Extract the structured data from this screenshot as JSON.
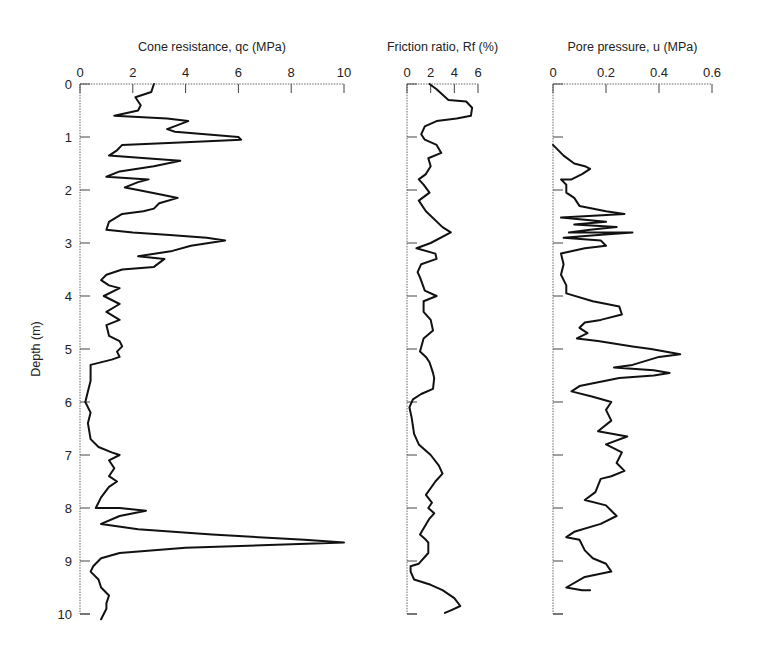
{
  "figure": {
    "ylabel": "Depth (m)"
  },
  "chart_data": [
    {
      "type": "line",
      "title": "Cone resistance, qc (MPa)",
      "xlabel": "Cone resistance, qc (MPa)",
      "ylabel": "Depth (m)",
      "xlim": [
        0,
        10
      ],
      "ylim": [
        10,
        0
      ],
      "x_ticks": [
        0,
        2,
        4,
        6,
        8,
        10
      ],
      "y_ticks": [
        0,
        1,
        2,
        3,
        4,
        5,
        6,
        7,
        8,
        9,
        10
      ],
      "x_axis_position": "top",
      "grid": false,
      "series": [
        {
          "name": "qc",
          "points": [
            [
              2.8,
              0.0
            ],
            [
              2.7,
              0.15
            ],
            [
              2.1,
              0.25
            ],
            [
              2.3,
              0.4
            ],
            [
              2.2,
              0.5
            ],
            [
              1.3,
              0.6
            ],
            [
              3.3,
              0.65
            ],
            [
              4.1,
              0.7
            ],
            [
              3.3,
              0.85
            ],
            [
              3.6,
              0.9
            ],
            [
              6.0,
              1.0
            ],
            [
              6.1,
              1.05
            ],
            [
              4.0,
              1.1
            ],
            [
              1.6,
              1.15
            ],
            [
              1.4,
              1.25
            ],
            [
              1.1,
              1.35
            ],
            [
              2.5,
              1.4
            ],
            [
              3.8,
              1.45
            ],
            [
              2.8,
              1.55
            ],
            [
              1.5,
              1.65
            ],
            [
              1.0,
              1.75
            ],
            [
              2.6,
              1.8
            ],
            [
              2.2,
              1.85
            ],
            [
              1.7,
              1.95
            ],
            [
              2.2,
              2.0
            ],
            [
              3.2,
              2.1
            ],
            [
              3.7,
              2.15
            ],
            [
              3.0,
              2.25
            ],
            [
              2.8,
              2.35
            ],
            [
              2.4,
              2.4
            ],
            [
              1.6,
              2.45
            ],
            [
              1.1,
              2.6
            ],
            [
              1.0,
              2.75
            ],
            [
              2.0,
              2.8
            ],
            [
              3.4,
              2.85
            ],
            [
              4.8,
              2.9
            ],
            [
              5.5,
              2.95
            ],
            [
              4.2,
              3.05
            ],
            [
              3.5,
              3.15
            ],
            [
              2.2,
              3.25
            ],
            [
              3.2,
              3.3
            ],
            [
              2.8,
              3.45
            ],
            [
              1.6,
              3.5
            ],
            [
              1.0,
              3.6
            ],
            [
              0.8,
              3.7
            ],
            [
              1.1,
              3.8
            ],
            [
              1.5,
              3.85
            ],
            [
              0.9,
              4.0
            ],
            [
              1.5,
              4.15
            ],
            [
              1.0,
              4.3
            ],
            [
              1.5,
              4.45
            ],
            [
              1.0,
              4.55
            ],
            [
              1.1,
              4.75
            ],
            [
              1.5,
              4.85
            ],
            [
              1.6,
              4.95
            ],
            [
              1.4,
              5.05
            ],
            [
              1.5,
              5.15
            ],
            [
              1.2,
              5.2
            ],
            [
              0.4,
              5.3
            ],
            [
              0.4,
              5.6
            ],
            [
              0.3,
              5.8
            ],
            [
              0.2,
              6.0
            ],
            [
              0.4,
              6.2
            ],
            [
              0.3,
              6.4
            ],
            [
              0.4,
              6.7
            ],
            [
              0.7,
              6.85
            ],
            [
              1.2,
              6.95
            ],
            [
              1.5,
              7.0
            ],
            [
              1.1,
              7.1
            ],
            [
              1.3,
              7.25
            ],
            [
              1.1,
              7.4
            ],
            [
              1.4,
              7.5
            ],
            [
              1.1,
              7.6
            ],
            [
              0.8,
              7.8
            ],
            [
              0.6,
              8.0
            ],
            [
              1.5,
              8.0
            ],
            [
              2.5,
              8.05
            ],
            [
              1.5,
              8.15
            ],
            [
              0.8,
              8.3
            ],
            [
              2.2,
              8.4
            ],
            [
              5.0,
              8.5
            ],
            [
              8.5,
              8.6
            ],
            [
              10.0,
              8.65
            ],
            [
              8.3,
              8.68
            ],
            [
              4.0,
              8.75
            ],
            [
              1.5,
              8.85
            ],
            [
              0.8,
              8.95
            ],
            [
              0.5,
              9.1
            ],
            [
              0.4,
              9.2
            ],
            [
              0.7,
              9.35
            ],
            [
              0.8,
              9.5
            ],
            [
              1.1,
              9.65
            ],
            [
              1.0,
              9.8
            ],
            [
              1.0,
              9.9
            ],
            [
              0.8,
              10.1
            ]
          ]
        }
      ]
    },
    {
      "type": "line",
      "title": "Friction ratio, Rf (%)",
      "xlabel": "Friction ratio, Rf (%)",
      "ylabel": "Depth (m)",
      "xlim": [
        0,
        6
      ],
      "ylim": [
        10,
        0
      ],
      "x_ticks": [
        0,
        2,
        4,
        6
      ],
      "x_axis_position": "top",
      "grid": false,
      "series": [
        {
          "name": "Rf",
          "points": [
            [
              1.9,
              0.0
            ],
            [
              2.5,
              0.1
            ],
            [
              3.5,
              0.3
            ],
            [
              5.0,
              0.33
            ],
            [
              5.5,
              0.45
            ],
            [
              5.4,
              0.6
            ],
            [
              4.2,
              0.65
            ],
            [
              2.5,
              0.7
            ],
            [
              1.5,
              0.8
            ],
            [
              1.2,
              0.95
            ],
            [
              1.5,
              1.05
            ],
            [
              2.5,
              1.15
            ],
            [
              2.9,
              1.3
            ],
            [
              1.8,
              1.4
            ],
            [
              2.0,
              1.55
            ],
            [
              1.6,
              1.7
            ],
            [
              1.0,
              1.8
            ],
            [
              1.4,
              1.9
            ],
            [
              1.9,
              2.05
            ],
            [
              1.0,
              2.2
            ],
            [
              1.6,
              2.4
            ],
            [
              3.0,
              2.7
            ],
            [
              3.7,
              2.8
            ],
            [
              2.0,
              3.0
            ],
            [
              0.8,
              3.1
            ],
            [
              2.4,
              3.2
            ],
            [
              2.5,
              3.3
            ],
            [
              1.2,
              3.4
            ],
            [
              0.9,
              3.55
            ],
            [
              1.1,
              3.65
            ],
            [
              1.5,
              3.9
            ],
            [
              2.5,
              4.0
            ],
            [
              1.4,
              4.1
            ],
            [
              1.4,
              4.3
            ],
            [
              2.0,
              4.45
            ],
            [
              2.2,
              4.65
            ],
            [
              1.4,
              4.8
            ],
            [
              1.1,
              5.05
            ],
            [
              1.6,
              5.15
            ],
            [
              1.9,
              5.25
            ],
            [
              2.2,
              5.45
            ],
            [
              2.3,
              5.55
            ],
            [
              2.2,
              5.75
            ],
            [
              1.2,
              5.85
            ],
            [
              0.5,
              5.95
            ],
            [
              0.2,
              6.1
            ],
            [
              0.4,
              6.3
            ],
            [
              0.6,
              6.6
            ],
            [
              1.0,
              6.8
            ],
            [
              2.0,
              7.0
            ],
            [
              2.7,
              7.2
            ],
            [
              3.0,
              7.35
            ],
            [
              2.4,
              7.5
            ],
            [
              1.6,
              7.75
            ],
            [
              2.1,
              7.9
            ],
            [
              1.8,
              8.0
            ],
            [
              2.3,
              8.1
            ],
            [
              1.9,
              8.2
            ],
            [
              1.1,
              8.5
            ],
            [
              1.6,
              8.6
            ],
            [
              1.8,
              8.65
            ],
            [
              1.8,
              8.85
            ],
            [
              1.0,
              9.05
            ],
            [
              0.3,
              9.1
            ],
            [
              0.3,
              9.2
            ],
            [
              0.6,
              9.35
            ],
            [
              2.0,
              9.45
            ],
            [
              3.0,
              9.55
            ],
            [
              4.0,
              9.7
            ],
            [
              4.5,
              9.85
            ],
            [
              3.8,
              9.92
            ],
            [
              3.2,
              9.98
            ]
          ]
        }
      ]
    },
    {
      "type": "line",
      "title": "Pore pressure, u (MPa)",
      "xlabel": "Pore pressure, u (MPa)",
      "ylabel": "Depth (m)",
      "xlim": [
        0,
        0.6
      ],
      "ylim": [
        10,
        0
      ],
      "x_ticks": [
        0,
        0.2,
        0.4,
        0.6
      ],
      "x_axis_position": "top",
      "grid": false,
      "series": [
        {
          "name": "u",
          "points": [
            [
              0.0,
              1.15
            ],
            [
              0.04,
              1.35
            ],
            [
              0.08,
              1.5
            ],
            [
              0.12,
              1.55
            ],
            [
              0.14,
              1.6
            ],
            [
              0.11,
              1.7
            ],
            [
              0.07,
              1.8
            ],
            [
              0.03,
              1.8
            ],
            [
              0.05,
              1.9
            ],
            [
              0.05,
              2.05
            ],
            [
              0.08,
              2.15
            ],
            [
              0.1,
              2.3
            ],
            [
              0.2,
              2.4
            ],
            [
              0.27,
              2.45
            ],
            [
              0.1,
              2.5
            ],
            [
              0.03,
              2.52
            ],
            [
              0.2,
              2.6
            ],
            [
              0.08,
              2.65
            ],
            [
              0.24,
              2.7
            ],
            [
              0.14,
              2.75
            ],
            [
              0.06,
              2.8
            ],
            [
              0.3,
              2.8
            ],
            [
              0.17,
              2.85
            ],
            [
              0.04,
              2.9
            ],
            [
              0.18,
              2.95
            ],
            [
              0.2,
              3.05
            ],
            [
              0.12,
              3.1
            ],
            [
              0.03,
              3.2
            ],
            [
              0.04,
              3.4
            ],
            [
              0.03,
              3.6
            ],
            [
              0.05,
              3.8
            ],
            [
              0.05,
              3.95
            ],
            [
              0.15,
              4.1
            ],
            [
              0.25,
              4.2
            ],
            [
              0.26,
              4.35
            ],
            [
              0.18,
              4.45
            ],
            [
              0.12,
              4.5
            ],
            [
              0.1,
              4.6
            ],
            [
              0.13,
              4.7
            ],
            [
              0.09,
              4.8
            ],
            [
              0.17,
              4.85
            ],
            [
              0.3,
              4.95
            ],
            [
              0.37,
              5.0
            ],
            [
              0.48,
              5.1
            ],
            [
              0.4,
              5.15
            ],
            [
              0.3,
              5.3
            ],
            [
              0.23,
              5.35
            ],
            [
              0.38,
              5.4
            ],
            [
              0.44,
              5.45
            ],
            [
              0.38,
              5.5
            ],
            [
              0.25,
              5.55
            ],
            [
              0.1,
              5.7
            ],
            [
              0.07,
              5.8
            ],
            [
              0.15,
              5.9
            ],
            [
              0.22,
              6.0
            ],
            [
              0.2,
              6.15
            ],
            [
              0.22,
              6.35
            ],
            [
              0.17,
              6.55
            ],
            [
              0.28,
              6.65
            ],
            [
              0.2,
              6.8
            ],
            [
              0.26,
              6.95
            ],
            [
              0.24,
              7.15
            ],
            [
              0.27,
              7.3
            ],
            [
              0.22,
              7.4
            ],
            [
              0.18,
              7.45
            ],
            [
              0.16,
              7.7
            ],
            [
              0.12,
              7.85
            ],
            [
              0.2,
              7.95
            ],
            [
              0.24,
              8.15
            ],
            [
              0.18,
              8.3
            ],
            [
              0.08,
              8.45
            ],
            [
              0.05,
              8.55
            ],
            [
              0.1,
              8.6
            ],
            [
              0.12,
              8.8
            ],
            [
              0.15,
              8.95
            ],
            [
              0.2,
              9.05
            ],
            [
              0.22,
              9.2
            ],
            [
              0.12,
              9.3
            ],
            [
              0.05,
              9.5
            ],
            [
              0.11,
              9.55
            ],
            [
              0.14,
              9.55
            ]
          ]
        }
      ]
    }
  ]
}
